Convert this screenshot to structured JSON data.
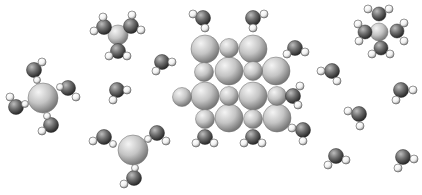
{
  "figure": {
    "width": 422,
    "height": 195,
    "background": "#ffffff",
    "colors": {
      "large": {
        "light": "#f4f4f4",
        "mid": "#c4c4c4",
        "dark": "#7a7a7a",
        "stroke": "#6a6a6a"
      },
      "oxygen": {
        "light": "#bdbdbd",
        "mid": "#6e6e6e",
        "dark": "#2a2a2a",
        "stroke": "#2a2a2a"
      },
      "hydrogen": {
        "light": "#ffffff",
        "mid": "#f0f0f0",
        "dark": "#9a9a9a",
        "stroke": "#555555"
      }
    }
  },
  "chart_data": {
    "type": "diagram",
    "title": "",
    "atoms": [
      {
        "k": "H",
        "x": 103,
        "y": 17,
        "r": 4
      },
      {
        "k": "H",
        "x": 132,
        "y": 15,
        "r": 4
      },
      {
        "k": "O",
        "x": 104,
        "y": 27,
        "r": 7.5
      },
      {
        "k": "O",
        "x": 131,
        "y": 26,
        "r": 7.5
      },
      {
        "k": "H",
        "x": 94,
        "y": 31,
        "r": 4
      },
      {
        "k": "H",
        "x": 141,
        "y": 30,
        "r": 4
      },
      {
        "k": "L",
        "x": 118,
        "y": 35,
        "r": 10
      },
      {
        "k": "O",
        "x": 118,
        "y": 51,
        "r": 7.5
      },
      {
        "k": "H",
        "x": 109,
        "y": 56,
        "r": 4
      },
      {
        "k": "H",
        "x": 127,
        "y": 56,
        "r": 4
      },
      {
        "k": "H",
        "x": 42,
        "y": 62,
        "r": 4
      },
      {
        "k": "O",
        "x": 34,
        "y": 70,
        "r": 7.5
      },
      {
        "k": "H",
        "x": 37,
        "y": 80,
        "r": 3.5
      },
      {
        "k": "O",
        "x": 68,
        "y": 88,
        "r": 7.5
      },
      {
        "k": "H",
        "x": 60,
        "y": 87,
        "r": 3.5
      },
      {
        "k": "H",
        "x": 76,
        "y": 97,
        "r": 4
      },
      {
        "k": "H",
        "x": 10,
        "y": 97,
        "r": 4
      },
      {
        "k": "O",
        "x": 16,
        "y": 107,
        "r": 7.5
      },
      {
        "k": "H",
        "x": 25,
        "y": 104,
        "r": 3.5
      },
      {
        "k": "L",
        "x": 43,
        "y": 98,
        "r": 15
      },
      {
        "k": "H",
        "x": 47,
        "y": 116,
        "r": 3.5
      },
      {
        "k": "O",
        "x": 51,
        "y": 125,
        "r": 7.5
      },
      {
        "k": "H",
        "x": 42,
        "y": 131,
        "r": 4
      },
      {
        "k": "O",
        "x": 162,
        "y": 62,
        "r": 7.5
      },
      {
        "k": "H",
        "x": 172,
        "y": 62,
        "r": 4
      },
      {
        "k": "H",
        "x": 156,
        "y": 71,
        "r": 4
      },
      {
        "k": "O",
        "x": 117,
        "y": 90,
        "r": 7.5
      },
      {
        "k": "H",
        "x": 127,
        "y": 90,
        "r": 4
      },
      {
        "k": "H",
        "x": 113,
        "y": 100,
        "r": 4
      },
      {
        "k": "H",
        "x": 93,
        "y": 141,
        "r": 4
      },
      {
        "k": "O",
        "x": 104,
        "y": 137,
        "r": 7.5
      },
      {
        "k": "H",
        "x": 113,
        "y": 144,
        "r": 3.5
      },
      {
        "k": "O",
        "x": 157,
        "y": 133,
        "r": 7.5
      },
      {
        "k": "H",
        "x": 148,
        "y": 139,
        "r": 3.5
      },
      {
        "k": "H",
        "x": 166,
        "y": 141,
        "r": 4
      },
      {
        "k": "L",
        "x": 133,
        "y": 150,
        "r": 15
      },
      {
        "k": "H",
        "x": 135,
        "y": 168,
        "r": 3.5
      },
      {
        "k": "O",
        "x": 134,
        "y": 178,
        "r": 7.5
      },
      {
        "k": "H",
        "x": 124,
        "y": 184,
        "r": 4
      },
      {
        "k": "H",
        "x": 193,
        "y": 14,
        "r": 4
      },
      {
        "k": "O",
        "x": 203,
        "y": 18,
        "r": 7.5
      },
      {
        "k": "H",
        "x": 205,
        "y": 28,
        "r": 4
      },
      {
        "k": "H",
        "x": 264,
        "y": 14,
        "r": 4
      },
      {
        "k": "O",
        "x": 253,
        "y": 18,
        "r": 7.5
      },
      {
        "k": "H",
        "x": 253,
        "y": 28,
        "r": 4
      },
      {
        "k": "L",
        "x": 205,
        "y": 49,
        "r": 14
      },
      {
        "k": "S",
        "x": 229,
        "y": 48,
        "r": 9.5
      },
      {
        "k": "L",
        "x": 253,
        "y": 49,
        "r": 14
      },
      {
        "k": "H",
        "x": 287,
        "y": 54,
        "r": 4
      },
      {
        "k": "O",
        "x": 295,
        "y": 48,
        "r": 7.5
      },
      {
        "k": "H",
        "x": 305,
        "y": 52,
        "r": 4
      },
      {
        "k": "S",
        "x": 204,
        "y": 72,
        "r": 9.5
      },
      {
        "k": "L",
        "x": 229,
        "y": 71,
        "r": 14
      },
      {
        "k": "S",
        "x": 253,
        "y": 71,
        "r": 9.5
      },
      {
        "k": "L",
        "x": 276,
        "y": 71,
        "r": 14
      },
      {
        "k": "S",
        "x": 182,
        "y": 97,
        "r": 9.5
      },
      {
        "k": "L",
        "x": 205,
        "y": 96,
        "r": 14
      },
      {
        "k": "S",
        "x": 229,
        "y": 96,
        "r": 9.5
      },
      {
        "k": "L",
        "x": 253,
        "y": 96,
        "r": 14
      },
      {
        "k": "S",
        "x": 277,
        "y": 96,
        "r": 9.5
      },
      {
        "k": "H",
        "x": 300,
        "y": 86,
        "r": 4
      },
      {
        "k": "O",
        "x": 293,
        "y": 96,
        "r": 7.5
      },
      {
        "k": "H",
        "x": 298,
        "y": 105,
        "r": 4
      },
      {
        "k": "S",
        "x": 205,
        "y": 119,
        "r": 9.5
      },
      {
        "k": "L",
        "x": 229,
        "y": 118,
        "r": 14
      },
      {
        "k": "S",
        "x": 253,
        "y": 119,
        "r": 9.5
      },
      {
        "k": "L",
        "x": 277,
        "y": 118,
        "r": 14
      },
      {
        "k": "H",
        "x": 292,
        "y": 128,
        "r": 4
      },
      {
        "k": "O",
        "x": 303,
        "y": 130,
        "r": 7.5
      },
      {
        "k": "H",
        "x": 303,
        "y": 141,
        "r": 4
      },
      {
        "k": "O",
        "x": 205,
        "y": 137,
        "r": 7.5
      },
      {
        "k": "H",
        "x": 196,
        "y": 143,
        "r": 4
      },
      {
        "k": "H",
        "x": 214,
        "y": 143,
        "r": 4
      },
      {
        "k": "O",
        "x": 253,
        "y": 137,
        "r": 7.5
      },
      {
        "k": "H",
        "x": 244,
        "y": 143,
        "r": 4
      },
      {
        "k": "H",
        "x": 262,
        "y": 143,
        "r": 4
      },
      {
        "k": "H",
        "x": 368,
        "y": 9,
        "r": 4
      },
      {
        "k": "H",
        "x": 389,
        "y": 9,
        "r": 4
      },
      {
        "k": "O",
        "x": 379,
        "y": 14,
        "r": 7
      },
      {
        "k": "H",
        "x": 358,
        "y": 24,
        "r": 4
      },
      {
        "k": "H",
        "x": 404,
        "y": 23,
        "r": 4
      },
      {
        "k": "O",
        "x": 365,
        "y": 32,
        "r": 7
      },
      {
        "k": "L",
        "x": 379,
        "y": 32,
        "r": 9
      },
      {
        "k": "O",
        "x": 397,
        "y": 31,
        "r": 7
      },
      {
        "k": "H",
        "x": 359,
        "y": 41,
        "r": 4
      },
      {
        "k": "H",
        "x": 404,
        "y": 41,
        "r": 4
      },
      {
        "k": "O",
        "x": 381,
        "y": 48,
        "r": 7
      },
      {
        "k": "H",
        "x": 372,
        "y": 54,
        "r": 4
      },
      {
        "k": "H",
        "x": 390,
        "y": 54,
        "r": 4
      },
      {
        "k": "H",
        "x": 321,
        "y": 71,
        "r": 4
      },
      {
        "k": "O",
        "x": 332,
        "y": 71,
        "r": 7.5
      },
      {
        "k": "H",
        "x": 337,
        "y": 81,
        "r": 4
      },
      {
        "k": "O",
        "x": 401,
        "y": 90,
        "r": 7.5
      },
      {
        "k": "H",
        "x": 413,
        "y": 90,
        "r": 4
      },
      {
        "k": "H",
        "x": 396,
        "y": 100,
        "r": 4
      },
      {
        "k": "H",
        "x": 348,
        "y": 111,
        "r": 4
      },
      {
        "k": "O",
        "x": 359,
        "y": 114,
        "r": 7.5
      },
      {
        "k": "H",
        "x": 360,
        "y": 126,
        "r": 4
      },
      {
        "k": "O",
        "x": 336,
        "y": 156,
        "r": 7.5
      },
      {
        "k": "H",
        "x": 346,
        "y": 160,
        "r": 4
      },
      {
        "k": "H",
        "x": 328,
        "y": 165,
        "r": 4
      },
      {
        "k": "O",
        "x": 403,
        "y": 157,
        "r": 7.5
      },
      {
        "k": "H",
        "x": 414,
        "y": 159,
        "r": 4
      },
      {
        "k": "H",
        "x": 398,
        "y": 168,
        "r": 4
      }
    ]
  }
}
